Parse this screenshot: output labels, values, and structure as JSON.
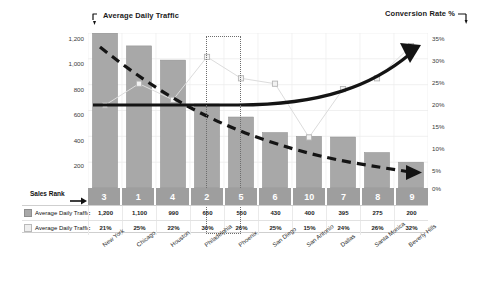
{
  "chart_data": {
    "type": "bar",
    "title": "",
    "axis_titles": {
      "left": "Average Daily Traffic",
      "right": "Conversion Rate %"
    },
    "categories": [
      "New York",
      "Chicago",
      "Houston",
      "Philadelphia",
      "Phoenix",
      "San Diego",
      "San Antonio",
      "Dallas",
      "Santa Monica",
      "Beverly Hills"
    ],
    "series": [
      {
        "name": "Average Daily Traffic",
        "type": "bar",
        "axis": "left",
        "values": [
          1200,
          1100,
          990,
          650,
          550,
          430,
          400,
          395,
          275,
          200
        ],
        "labels": [
          "1,200",
          "1,100",
          "990",
          "650",
          "550",
          "430",
          "400",
          "395",
          "275",
          "200"
        ],
        "color": "#a8a8a8"
      },
      {
        "name": "Average Daily Traffic",
        "type": "line",
        "axis": "right",
        "values": [
          21,
          25,
          22,
          30,
          26,
          25,
          15,
          24,
          26,
          32
        ],
        "labels": [
          "21%",
          "25%",
          "22%",
          "30%",
          "26%",
          "25%",
          "15%",
          "24%",
          "26%",
          "32%"
        ],
        "color": "#d9d9d9"
      }
    ],
    "rank_row": {
      "label": "Sales Rank",
      "values": [
        "3",
        "1",
        "4",
        "2",
        "5",
        "6",
        "10",
        "7",
        "8",
        "9"
      ]
    },
    "ylim_left": [
      0,
      1200
    ],
    "yticks_left": [
      "1,200",
      "1,000",
      "800",
      "600",
      "400",
      "200"
    ],
    "ylim_right": [
      0,
      35
    ],
    "yticks_right": [
      "35%",
      "30%",
      "25%",
      "20%",
      "15%",
      "10%",
      "5%",
      "0%"
    ],
    "grid": true,
    "legend_position": "bottom-left",
    "annotations": [
      {
        "name": "trend-dashed-down",
        "style": "dashed",
        "color": "#141414",
        "direction": "down-right"
      },
      {
        "name": "trend-solid-up",
        "style": "solid",
        "color": "#141414",
        "direction": "up-right"
      },
      {
        "name": "highlight-box",
        "style": "dotted",
        "color": "#6d6d6d",
        "target": "Philadelphia"
      }
    ]
  }
}
